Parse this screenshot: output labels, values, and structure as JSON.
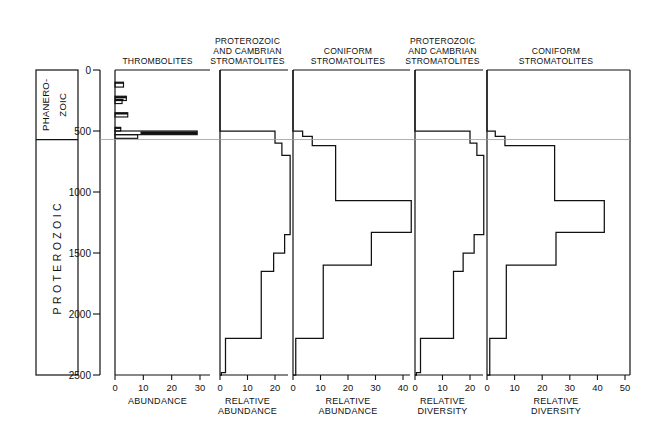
{
  "figure": {
    "caption_title": "Secular distribution of thrombolites and stromatolites",
    "era_labels": {
      "phanerozoic_line1": "PHANERO-",
      "phanerozoic_line2": "ZOIC",
      "proterozoic": "PROTEROZOIC"
    },
    "y_axis": {
      "label": "",
      "unit": "Ma",
      "ticks": [
        0,
        500,
        1000,
        1500,
        2000,
        2500
      ],
      "tick_labels": [
        "0",
        "500",
        "1000",
        "1500",
        "2000",
        "2500"
      ],
      "range": [
        0,
        2500
      ],
      "direction": "increasing-downward"
    },
    "phanerozoic_boundary_ma": 570
  },
  "chart_data": [
    {
      "id": "panel-thrombolites",
      "type": "bar",
      "orientation": "horizontal",
      "title": "THROMBOLITES",
      "title_lines": [
        "THROMBOLITES"
      ],
      "xlabel": "ABUNDANCE",
      "xlabel_lines": [
        "ABUNDANCE"
      ],
      "ylabel": "",
      "xlim": [
        0,
        35
      ],
      "xticks": [
        0,
        10,
        20,
        30
      ],
      "xtick_labels": [
        "0",
        "10",
        "20",
        "30"
      ],
      "ylim": [
        0,
        2500
      ],
      "grid": false,
      "bins_ma": [
        [
          0,
          2500
        ]
      ],
      "bars": [
        {
          "top_ma": 100,
          "bottom_ma": 140,
          "value": 3.0
        },
        {
          "top_ma": 215,
          "bottom_ma": 250,
          "value": 4.0
        },
        {
          "top_ma": 250,
          "bottom_ma": 275,
          "value": 2.5
        },
        {
          "top_ma": 350,
          "bottom_ma": 385,
          "value": 4.5
        },
        {
          "top_ma": 470,
          "bottom_ma": 500,
          "value": 2.0
        },
        {
          "top_ma": 500,
          "bottom_ma": 530,
          "value": 29.0
        },
        {
          "top_ma": 530,
          "bottom_ma": 560,
          "value": 8.0
        }
      ]
    },
    {
      "id": "panel-proterozoic-cambrian-stromatolites-abundance",
      "type": "line",
      "sub_type": "step-histogram",
      "orientation": "horizontal",
      "title": "PROTEROZOIC AND CAMBRIAN STROMATOLITES",
      "title_lines": [
        "PROTEROZOIC",
        "AND CAMBRIAN",
        "STROMATOLITES"
      ],
      "xlabel": "RELATIVE ABUNDANCE",
      "xlabel_lines": [
        "RELATIVE",
        "ABUNDANCE"
      ],
      "xlim": [
        0,
        26
      ],
      "xticks": [
        0,
        10,
        20
      ],
      "xtick_labels": [
        "0",
        "10",
        "20"
      ],
      "ylim": [
        0,
        2500
      ],
      "grid": false,
      "steps": [
        {
          "top_ma": 500,
          "bottom_ma": 600,
          "value": 20.0
        },
        {
          "top_ma": 600,
          "bottom_ma": 700,
          "value": 22.5
        },
        {
          "top_ma": 700,
          "bottom_ma": 1350,
          "value": 25.5
        },
        {
          "top_ma": 1350,
          "bottom_ma": 1500,
          "value": 23.5
        },
        {
          "top_ma": 1500,
          "bottom_ma": 1650,
          "value": 19.5
        },
        {
          "top_ma": 1650,
          "bottom_ma": 2200,
          "value": 15.0
        },
        {
          "top_ma": 2200,
          "bottom_ma": 2480,
          "value": 2.0
        },
        {
          "top_ma": 2480,
          "bottom_ma": 2500,
          "value": 0.5
        }
      ]
    },
    {
      "id": "panel-coniform-stromatolites-abundance",
      "type": "line",
      "sub_type": "step-histogram",
      "orientation": "horizontal",
      "title": "CONIFORM STROMATOLITES",
      "title_lines": [
        "CONIFORM",
        "STROMATOLITES"
      ],
      "xlabel": "RELATIVE ABUNDANCE",
      "xlabel_lines": [
        "RELATIVE",
        "ABUNDANCE"
      ],
      "xlim": [
        0,
        47
      ],
      "xticks": [
        0,
        10,
        20,
        30,
        40
      ],
      "xtick_labels": [
        "0",
        "10",
        "20",
        "30",
        "40"
      ],
      "ylim": [
        0,
        2500
      ],
      "grid": false,
      "steps": [
        {
          "top_ma": 500,
          "bottom_ma": 545,
          "value": 3.5
        },
        {
          "top_ma": 545,
          "bottom_ma": 620,
          "value": 7.0
        },
        {
          "top_ma": 620,
          "bottom_ma": 1070,
          "value": 15.5
        },
        {
          "top_ma": 1070,
          "bottom_ma": 1330,
          "value": 43.0
        },
        {
          "top_ma": 1330,
          "bottom_ma": 1600,
          "value": 28.5
        },
        {
          "top_ma": 1600,
          "bottom_ma": 2200,
          "value": 11.0
        },
        {
          "top_ma": 2200,
          "bottom_ma": 2500,
          "value": 1.0
        }
      ]
    },
    {
      "id": "panel-proterozoic-cambrian-stromatolites-diversity",
      "type": "line",
      "sub_type": "step-histogram",
      "orientation": "horizontal",
      "title": "PROTEROZOIC AND CAMBRIAN STROMATOLITES",
      "title_lines": [
        "PROTEROZOIC",
        "AND CAMBRIAN",
        "STROMATOLITES"
      ],
      "xlabel": "RELATIVE DIVERSITY",
      "xlabel_lines": [
        "RELATIVE",
        "DIVERSITY"
      ],
      "xlim": [
        0,
        26
      ],
      "xticks": [
        0,
        10,
        20
      ],
      "xtick_labels": [
        "0",
        "10",
        "20"
      ],
      "ylim": [
        0,
        2500
      ],
      "grid": false,
      "steps": [
        {
          "top_ma": 500,
          "bottom_ma": 600,
          "value": 20.0
        },
        {
          "top_ma": 600,
          "bottom_ma": 700,
          "value": 22.5
        },
        {
          "top_ma": 700,
          "bottom_ma": 1350,
          "value": 25.0
        },
        {
          "top_ma": 1350,
          "bottom_ma": 1500,
          "value": 21.5
        },
        {
          "top_ma": 1500,
          "bottom_ma": 1650,
          "value": 17.5
        },
        {
          "top_ma": 1650,
          "bottom_ma": 2200,
          "value": 14.0
        },
        {
          "top_ma": 2200,
          "bottom_ma": 2480,
          "value": 2.0
        },
        {
          "top_ma": 2480,
          "bottom_ma": 2500,
          "value": 0.5
        }
      ]
    },
    {
      "id": "panel-coniform-stromatolites-diversity",
      "type": "line",
      "sub_type": "step-histogram",
      "orientation": "horizontal",
      "title": "CONIFORM STROMATOLITES",
      "title_lines": [
        "CONIFORM",
        "STROMATOLITES"
      ],
      "xlabel": "RELATIVE DIVERSITY",
      "xlabel_lines": [
        "RELATIVE",
        "DIVERSITY"
      ],
      "xlim": [
        0,
        50
      ],
      "xticks": [
        0,
        10,
        20,
        30,
        40,
        50
      ],
      "xtick_labels": [
        "0",
        "10",
        "20",
        "30",
        "40",
        "50"
      ],
      "ylim": [
        0,
        2500
      ],
      "grid": false,
      "steps": [
        {
          "top_ma": 500,
          "bottom_ma": 545,
          "value": 3.0
        },
        {
          "top_ma": 545,
          "bottom_ma": 620,
          "value": 6.5
        },
        {
          "top_ma": 620,
          "bottom_ma": 1070,
          "value": 24.5
        },
        {
          "top_ma": 1070,
          "bottom_ma": 1330,
          "value": 42.5
        },
        {
          "top_ma": 1330,
          "bottom_ma": 1600,
          "value": 25.0
        },
        {
          "top_ma": 1600,
          "bottom_ma": 2200,
          "value": 7.0
        },
        {
          "top_ma": 2200,
          "bottom_ma": 2500,
          "value": 1.0
        }
      ]
    }
  ],
  "colors": {
    "ink": "#111111",
    "rule": "#9a9a9a",
    "background": "#ffffff"
  }
}
